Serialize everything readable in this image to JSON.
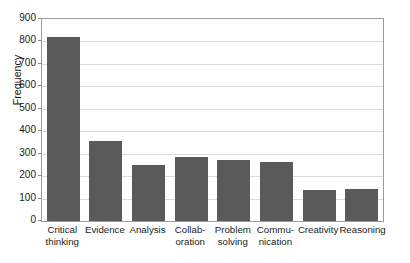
{
  "chart_data": {
    "type": "bar",
    "title": "",
    "subtitle": "",
    "xlabel": "",
    "ylabel": "Frequency",
    "ylim": [
      0,
      900
    ],
    "ytick_step": 100,
    "yticks": [
      "0",
      "100",
      "200",
      "300",
      "400",
      "500",
      "600",
      "700",
      "800",
      "900"
    ],
    "grid": "horizontal",
    "legend": "none",
    "orientation": "vertical",
    "bar_color": "#5a5a5a",
    "gridline_color": "#dcdcdc",
    "frame_color": "#9a9a9a",
    "background_color": "#ffffff",
    "categories": [
      "Critical thinking",
      "Evidence",
      "Analysis",
      "Collaboration",
      "Problem solving",
      "Communication",
      "Creativity",
      "Reasoning"
    ],
    "category_label_lines": [
      [
        "Critical",
        "thinking"
      ],
      [
        "Evidence"
      ],
      [
        "Analysis"
      ],
      [
        "Collab-",
        "oration"
      ],
      [
        "Problem",
        "solving"
      ],
      [
        "Commu-",
        "nication"
      ],
      [
        "Creativity"
      ],
      [
        "Reasoning"
      ]
    ],
    "values": [
      820,
      355,
      250,
      287,
      272,
      262,
      137,
      142
    ]
  }
}
